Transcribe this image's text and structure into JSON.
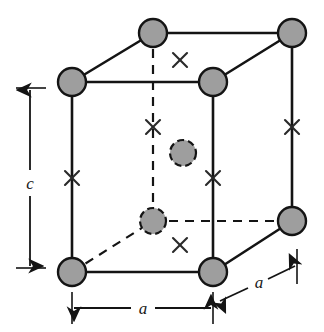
{
  "figure": {
    "name": "tetragonal-unit-cell-diagram",
    "width": 324,
    "height": 332,
    "background_color": "#ffffff"
  },
  "colors": {
    "atom_fill": "#9e9e9e",
    "atom_stroke": "#141414",
    "edge_solid": "#141414",
    "edge_dashed": "#141414",
    "cross_mark": "#2a2a2a",
    "dimension_line": "#141414",
    "label_text": "#1a1a1a"
  },
  "geometry": {
    "front_face": {
      "top_left": {
        "x": 72,
        "y": 82
      },
      "top_right": {
        "x": 213,
        "y": 82
      },
      "bottom_right": {
        "x": 213,
        "y": 272
      },
      "bottom_left": {
        "x": 72,
        "y": 272
      }
    },
    "rear_face": {
      "top_left": {
        "x": 153,
        "y": 33
      },
      "top_right": {
        "x": 292,
        "y": 33
      },
      "bottom_right": {
        "x": 292,
        "y": 221
      },
      "bottom_left": {
        "x": 153,
        "y": 221
      }
    },
    "depth_offset": {
      "dx": 81,
      "dy": -49
    },
    "corner_atom_radius": 14,
    "interior_atom_radius": 13
  },
  "atoms": {
    "corner_label": "corner-atom",
    "interior_label": "interior-atom",
    "corner_positions": [
      {
        "id": "front-top-left",
        "x": 72,
        "y": 82
      },
      {
        "id": "front-top-right",
        "x": 213,
        "y": 82
      },
      {
        "id": "front-bottom-left",
        "x": 72,
        "y": 272
      },
      {
        "id": "front-bottom-right",
        "x": 213,
        "y": 272
      },
      {
        "id": "rear-top-left",
        "x": 153,
        "y": 33
      },
      {
        "id": "rear-top-right",
        "x": 292,
        "y": 33
      },
      {
        "id": "rear-bottom-right",
        "x": 292,
        "y": 221
      }
    ],
    "interior_positions": [
      {
        "id": "interior-upper",
        "x": 183,
        "y": 153
      },
      {
        "id": "interior-lower",
        "x": 153,
        "y": 221
      }
    ]
  },
  "cross_marks": {
    "glyph": "×",
    "positions": [
      {
        "id": "cross-top-center",
        "x": 180,
        "y": 60
      },
      {
        "id": "cross-rear-vertical-upper",
        "x": 153,
        "y": 127
      },
      {
        "id": "cross-left-edge",
        "x": 72,
        "y": 178
      },
      {
        "id": "cross-front-right-edge",
        "x": 213,
        "y": 178
      },
      {
        "id": "cross-rear-right-edge",
        "x": 292,
        "y": 127
      },
      {
        "id": "cross-bottom-center",
        "x": 180,
        "y": 245
      }
    ]
  },
  "dimensions": [
    {
      "id": "height-c",
      "label": "c",
      "orientation": "vertical",
      "x": 30,
      "y_start": 88,
      "y_end": 268,
      "label_x": 30,
      "label_y": 184,
      "tick_start": {
        "x1": 15,
        "y1": 88,
        "x2": 45,
        "y2": 88
      },
      "tick_end": {
        "x1": 15,
        "y1": 268,
        "x2": 45,
        "y2": 268
      }
    },
    {
      "id": "width-a-horizontal",
      "label": "a",
      "orientation": "horizontal",
      "y": 308,
      "x_start": 72,
      "x_end": 213,
      "label_x": 143,
      "label_y": 314,
      "tick_start": {
        "x1": 72,
        "y1": 293,
        "x2": 72,
        "y2": 323
      },
      "tick_end": {
        "x1": 213,
        "y1": 293,
        "x2": 213,
        "y2": 323
      }
    },
    {
      "id": "depth-a-diagonal",
      "label": "a",
      "orientation": "diagonal",
      "x_start": 219,
      "y_start": 302,
      "x_end": 296,
      "y_end": 265,
      "label_x": 263,
      "label_y": 289,
      "tick_end": {
        "x1": 297,
        "y1": 250,
        "x2": 297,
        "y2": 283
      }
    }
  ]
}
